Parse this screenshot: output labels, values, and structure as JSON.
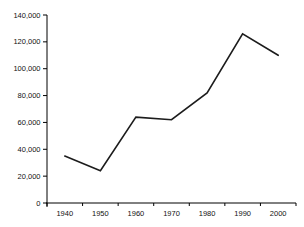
{
  "chart_data": {
    "type": "line",
    "title": "",
    "xlabel": "",
    "ylabel": "",
    "categories": [
      "1940",
      "1950",
      "1960",
      "1970",
      "1980",
      "1990",
      "2000"
    ],
    "series": [
      {
        "name": "series-1",
        "values": [
          35000,
          24000,
          64000,
          62000,
          82000,
          126000,
          110000
        ]
      }
    ],
    "ylim": [
      0,
      140000
    ],
    "ytick_step": 20000,
    "ytick_labels": [
      "0",
      "20,000",
      "40,000",
      "60,000",
      "80,000",
      "100,000",
      "120,000",
      "140,000"
    ],
    "grid": false,
    "legend": false,
    "markers": false,
    "colors": {
      "line": "#1c1c1c",
      "axis": "#000000",
      "label_text": "#111111",
      "background": "#ffffff"
    }
  }
}
